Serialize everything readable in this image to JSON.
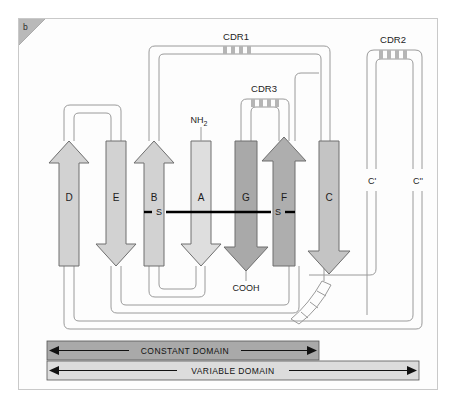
{
  "figure": {
    "panel_label": "b",
    "background": "#ffffff",
    "frame_border": "#c9c9c9"
  },
  "strands": [
    {
      "id": "D",
      "label": "D",
      "direction": "up",
      "fill": "#d2d2d2",
      "x": 50
    },
    {
      "id": "E",
      "label": "E",
      "direction": "down",
      "fill": "#d2d2d2",
      "x": 97
    },
    {
      "id": "B",
      "label": "B",
      "direction": "up",
      "fill": "#d2d2d2",
      "x": 135
    },
    {
      "id": "A",
      "label": "A",
      "direction": "down",
      "fill": "#dedede",
      "x": 182
    },
    {
      "id": "G",
      "label": "G",
      "direction": "down",
      "fill": "#a9a9a9",
      "x": 227
    },
    {
      "id": "F",
      "label": "F",
      "direction": "up",
      "fill": "#aeaeae",
      "x": 265
    },
    {
      "id": "C",
      "label": "C",
      "direction": "down",
      "fill": "#c4c4c4",
      "x": 310
    }
  ],
  "loops": [
    {
      "id": "CDR1",
      "label": "CDR1",
      "ticks": 4
    },
    {
      "id": "CDR2",
      "label": "CDR2",
      "ticks": 4
    },
    {
      "id": "CDR3",
      "label": "CDR3",
      "ticks": 4
    }
  ],
  "terminals": {
    "n_terminus": "NH",
    "n_terminus_sub": "2",
    "c_terminus": "COOH"
  },
  "disulfide": {
    "left_label": "S",
    "right_label": "S"
  },
  "strand_extra_labels": [
    {
      "id": "C-prime",
      "label": "C'",
      "x": 353
    },
    {
      "id": "C-double-prime",
      "label": "C''",
      "x": 399
    }
  ],
  "domain_bars": [
    {
      "id": "constant-domain",
      "label": "CONSTANT DOMAIN",
      "fill": "#a9a9a9",
      "x": 46,
      "width": 272,
      "y": 340
    },
    {
      "id": "variable-domain",
      "label": "VARIABLE DOMAIN",
      "fill": "#dcdcdc",
      "x": 46,
      "width": 372,
      "y": 362
    }
  ],
  "colors": {
    "ribbon_stroke": "#9a9a9a",
    "arrow_stroke": "#6e6e6e",
    "disulfide": "#000000",
    "tick": "#b5b5b5",
    "text": "#1c1c1c"
  }
}
